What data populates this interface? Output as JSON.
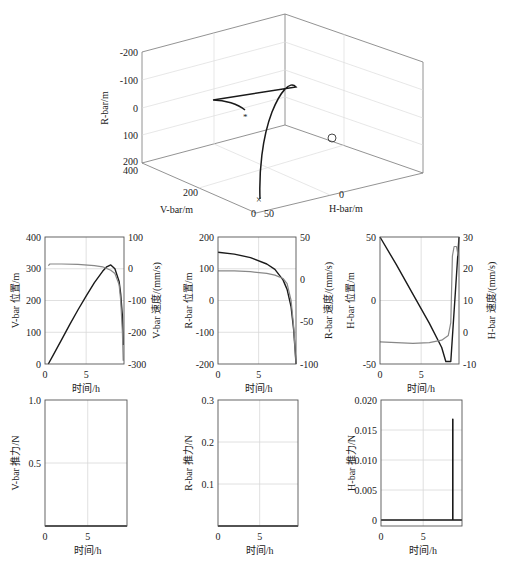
{
  "chart_data": [
    {
      "type": "line3d",
      "id": "trajectory-3d",
      "title": "",
      "axes": {
        "x": {
          "label": "H-bar/m",
          "ticks": [
            "0",
            "50"
          ]
        },
        "y": {
          "label": "V-bar/m",
          "ticks": [
            "0",
            "200",
            "400"
          ]
        },
        "z": {
          "label": "R-bar/m",
          "ticks": [
            "-200",
            "-100",
            "0",
            "100",
            "200"
          ],
          "reversed": true
        }
      },
      "markers": [
        {
          "name": "start",
          "symbol": "x",
          "desc": "cross at origin region"
        },
        {
          "name": "target",
          "symbol": "o",
          "desc": "circle on floor"
        },
        {
          "name": "end",
          "symbol": "*",
          "desc": "asterisk near trajectory end"
        }
      ],
      "grid": true
    },
    {
      "type": "line",
      "id": "vbar-position-velocity",
      "xlabel": "时间/h",
      "ylabel_left": "V-bar 位置/m",
      "ylabel_right": "V-bar 速度/(mm/s)",
      "x_ticks": [
        "0",
        "5"
      ],
      "xlim": [
        0,
        9.6
      ],
      "ylim_left": [
        0,
        400
      ],
      "ylim_right": [
        -300,
        100
      ],
      "y_ticks_left": [
        "0",
        "100",
        "200",
        "300",
        "400"
      ],
      "y_ticks_right": [
        "-300",
        "-200",
        "-100",
        "0",
        "100"
      ],
      "grid": true,
      "series": [
        {
          "name": "V-bar 位置",
          "axis": "left",
          "color": "#1a1a1a",
          "x": [
            0.4,
            1,
            2,
            3,
            4,
            5,
            6,
            7,
            7.5,
            8,
            8.5,
            9,
            9.2,
            9.4,
            9.5
          ],
          "y": [
            0,
            28,
            76,
            124,
            170,
            214,
            256,
            292,
            306,
            312,
            300,
            260,
            220,
            150,
            60
          ]
        },
        {
          "name": "V-bar 速度",
          "axis": "right",
          "color": "#888888",
          "x": [
            0.4,
            0.6,
            2,
            4,
            6,
            7,
            8,
            8.5,
            9,
            9.2,
            9.4,
            9.5
          ],
          "y": [
            10,
            15,
            15,
            14,
            10,
            6,
            -5,
            -15,
            -50,
            -100,
            -200,
            -290
          ]
        }
      ]
    },
    {
      "type": "line",
      "id": "rbar-position-velocity",
      "xlabel": "时间/h",
      "ylabel_left": "R-bar 位置/m",
      "ylabel_right": "R-bar 速度/(mm/s)",
      "x_ticks": [
        "0",
        "5"
      ],
      "xlim": [
        0,
        9.6
      ],
      "ylim_left": [
        -200,
        200
      ],
      "ylim_right": [
        -100,
        50
      ],
      "y_ticks_left": [
        "-200",
        "-100",
        "0",
        "100",
        "200"
      ],
      "y_ticks_right": [
        "-100",
        "-50",
        "0",
        "50"
      ],
      "grid": true,
      "series": [
        {
          "name": "R-bar 位置",
          "axis": "left",
          "color": "#1a1a1a",
          "x": [
            0,
            2,
            4,
            6,
            7,
            8,
            8.5,
            9,
            9.3,
            9.5,
            9.6
          ],
          "y": [
            152,
            146,
            135,
            115,
            98,
            65,
            35,
            -20,
            -90,
            -160,
            -200
          ]
        },
        {
          "name": "R-bar 速度",
          "axis": "right",
          "color": "#888888",
          "x": [
            0,
            2,
            4,
            6,
            7,
            8,
            8.5,
            9,
            9.3,
            9.5,
            9.6
          ],
          "y": [
            10,
            10,
            9,
            7,
            5,
            1,
            -5,
            -25,
            -55,
            -85,
            -100
          ]
        }
      ]
    },
    {
      "type": "line",
      "id": "hbar-position-velocity",
      "xlabel": "时间/h",
      "ylabel_left": "H-bar 位置/m",
      "ylabel_right": "H-bar 速度/(mm/s)",
      "x_ticks": [
        "0",
        "5"
      ],
      "xlim": [
        0,
        9.6
      ],
      "ylim_left": [
        -50,
        50
      ],
      "ylim_right": [
        -10,
        30
      ],
      "y_ticks_left": [
        "-50",
        "0",
        "50"
      ],
      "y_ticks_right": [
        "-10",
        "0",
        "10",
        "20",
        "30"
      ],
      "grid": true,
      "series": [
        {
          "name": "H-bar 位置",
          "axis": "left",
          "color": "#1a1a1a",
          "x": [
            0,
            2,
            4,
            6,
            7.5,
            8,
            8.6,
            9.6
          ],
          "y": [
            50,
            28,
            5,
            -18,
            -37,
            -48,
            -48,
            50
          ]
        },
        {
          "name": "H-bar 速度",
          "axis": "right",
          "color": "#888888",
          "x": [
            0,
            2,
            4,
            6,
            7.5,
            8.3,
            8.6,
            8.8,
            9.0,
            9.3,
            9.5
          ],
          "y": [
            -3,
            -3.3,
            -3.5,
            -3.3,
            -2.5,
            -1,
            3,
            24,
            27,
            27,
            24
          ]
        }
      ]
    },
    {
      "type": "line",
      "id": "vbar-thrust",
      "xlabel": "时间/h",
      "ylabel": "V-bar 推力/N",
      "x_ticks": [
        "0",
        "5"
      ],
      "xlim": [
        0,
        9.6
      ],
      "ylim": [
        0,
        1.0
      ],
      "y_ticks": [
        "0.5",
        "1.0"
      ],
      "grid": true,
      "series": [
        {
          "name": "V-bar 推力",
          "color": "#1a1a1a",
          "x": [
            0,
            9.6
          ],
          "y": [
            0,
            0
          ]
        }
      ]
    },
    {
      "type": "line",
      "id": "rbar-thrust",
      "xlabel": "时间/h",
      "ylabel": "R-bar 推力/N",
      "x_ticks": [
        "0",
        "5"
      ],
      "xlim": [
        0,
        9.6
      ],
      "ylim": [
        0,
        0.3
      ],
      "y_ticks": [
        "0.1",
        "0.2",
        "0.3"
      ],
      "grid": true,
      "series": [
        {
          "name": "R-bar 推力",
          "color": "#1a1a1a",
          "x": [
            0,
            9.6
          ],
          "y": [
            0,
            0
          ]
        }
      ]
    },
    {
      "type": "line",
      "id": "hbar-thrust",
      "xlabel": "时间/h",
      "ylabel": "H-bar 推力/N",
      "x_ticks": [
        "0",
        "5"
      ],
      "xlim": [
        0,
        9.6
      ],
      "ylim": [
        -0.001,
        0.02
      ],
      "y_ticks": [
        "0",
        "0.005",
        "0.010",
        "0.015",
        "0.020"
      ],
      "grid": true,
      "series": [
        {
          "name": "H-bar 推力",
          "color": "#1a1a1a",
          "x": [
            0,
            8.5,
            8.5,
            8.52,
            8.52,
            9.6
          ],
          "y": [
            0,
            0,
            0.0168,
            0.0168,
            0,
            0
          ]
        }
      ]
    }
  ],
  "labels": {
    "zero_origin": "0",
    "bottom_x_zero": "0"
  },
  "colors": {
    "primary_line": "#1a1a1a",
    "secondary_line": "#888888",
    "grid": "#d8d8d8",
    "axis": "#555555"
  }
}
